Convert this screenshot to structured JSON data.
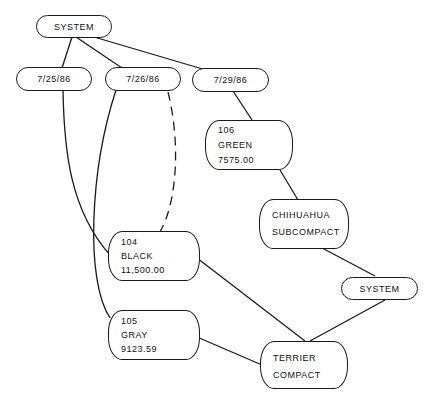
{
  "diagram": {
    "nodes": {
      "system_top": {
        "label": "SYSTEM"
      },
      "date1": {
        "label": "7/25/86"
      },
      "date2": {
        "label": "7/26/86"
      },
      "date3": {
        "label": "7/29/86"
      },
      "n106": {
        "lines": [
          "106",
          "GREEN",
          "7575.00"
        ]
      },
      "chihuahua": {
        "lines": [
          "CHIHUAHUA",
          "SUBCOMPACT"
        ]
      },
      "system_bottom": {
        "label": "SYSTEM"
      },
      "n104": {
        "lines": [
          "104",
          "BLACK",
          "11,500.00"
        ]
      },
      "n105": {
        "lines": [
          "105",
          "GRAY",
          "9123.59"
        ]
      },
      "terrier": {
        "lines": [
          "TERRIER",
          "COMPACT"
        ]
      }
    },
    "edges": [
      {
        "from": "SYSTEM",
        "to": "7/25/86",
        "style": "solid"
      },
      {
        "from": "SYSTEM",
        "to": "7/26/86",
        "style": "solid"
      },
      {
        "from": "SYSTEM",
        "to": "7/29/86",
        "style": "solid"
      },
      {
        "from": "7/25/86",
        "to": "104",
        "style": "solid"
      },
      {
        "from": "7/26/86",
        "to": "105",
        "style": "solid"
      },
      {
        "from": "7/26/86",
        "to": "104",
        "style": "dashed"
      },
      {
        "from": "7/29/86",
        "to": "106",
        "style": "solid"
      },
      {
        "from": "106",
        "to": "CHIHUAHUA SUBCOMPACT",
        "style": "solid"
      },
      {
        "from": "CHIHUAHUA SUBCOMPACT",
        "to": "SYSTEM",
        "style": "solid"
      },
      {
        "from": "SYSTEM",
        "to": "TERRIER COMPACT",
        "style": "solid"
      },
      {
        "from": "104",
        "to": "TERRIER COMPACT",
        "style": "solid"
      },
      {
        "from": "105",
        "to": "TERRIER COMPACT",
        "style": "solid"
      }
    ]
  }
}
